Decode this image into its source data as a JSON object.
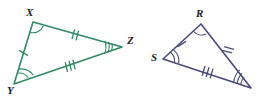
{
  "figure": {
    "kind": "geometry-congruent-triangles",
    "background": "#ffffff",
    "width": 273,
    "height": 100,
    "credit_text": "Banco de imagens"
  },
  "colors": {
    "triangle_left_stroke": "#2e8b62",
    "triangle_right_stroke": "#4a4a7a",
    "label_text": "#1c1c1c",
    "credit_text": "#7a7a7a",
    "background": "#ffffff"
  },
  "triangles": [
    {
      "id": "XYZ",
      "name": "triangle-xyz",
      "color": "#2e8b62",
      "vertices": [
        {
          "label": "X",
          "x": 33,
          "y": 22,
          "label_x": 26,
          "label_y": 7,
          "angle_arcs": 1
        },
        {
          "label": "Y",
          "x": 14,
          "y": 84,
          "label_x": 7,
          "label_y": 85,
          "angle_arcs": 2
        },
        {
          "label": "Z",
          "x": 122,
          "y": 47,
          "label_x": 127,
          "label_y": 35,
          "angle_arcs": 3
        }
      ],
      "sides": [
        {
          "from": "X",
          "to": "Y",
          "ticks": 1,
          "name": "side-xy"
        },
        {
          "from": "X",
          "to": "Z",
          "ticks": 2,
          "name": "side-xz"
        },
        {
          "from": "Y",
          "to": "Z",
          "ticks": 3,
          "name": "side-yz"
        }
      ]
    },
    {
      "id": "RS_",
      "name": "triangle-rs",
      "color": "#4a4a7a",
      "vertices": [
        {
          "label": "R",
          "x": 201,
          "y": 24,
          "label_x": 196,
          "label_y": 8,
          "angle_arcs": 1
        },
        {
          "label": "S",
          "x": 163,
          "y": 59,
          "label_x": 151,
          "label_y": 52,
          "angle_arcs": 2
        },
        {
          "label": "",
          "x": 251,
          "y": 88,
          "label_x": 0,
          "label_y": 0,
          "angle_arcs": 3
        }
      ],
      "sides": [
        {
          "from": "S",
          "to": "R",
          "ticks": 1,
          "name": "side-sr"
        },
        {
          "from": "R",
          "to": "T",
          "ticks": 2,
          "name": "side-rt"
        },
        {
          "from": "S",
          "to": "T",
          "ticks": 3,
          "name": "side-st"
        }
      ]
    }
  ]
}
